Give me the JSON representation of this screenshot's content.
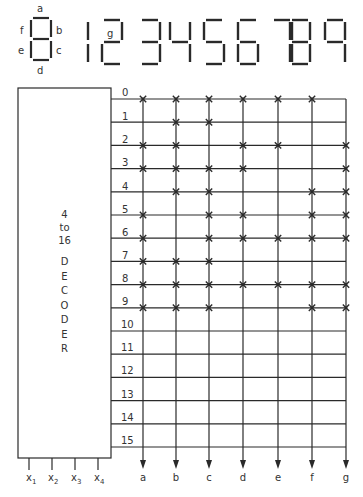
{
  "legend": {
    "segments": [
      {
        "name": "a",
        "label": "a"
      },
      {
        "name": "b",
        "label": "b"
      },
      {
        "name": "c",
        "label": "c"
      },
      {
        "name": "d",
        "label": "d"
      },
      {
        "name": "e",
        "label": "e"
      },
      {
        "name": "f",
        "label": "f"
      },
      {
        "name": "g",
        "label": "g"
      }
    ],
    "g_label": "g"
  },
  "digit_display": {
    "digits": [
      {
        "digit": "1",
        "segments": [
          "e",
          "f"
        ]
      },
      {
        "digit": "2",
        "segments": [
          "a",
          "b",
          "g",
          "e",
          "d"
        ]
      },
      {
        "digit": "3",
        "segments": [
          "a",
          "b",
          "g",
          "c",
          "d"
        ]
      },
      {
        "digit": "4",
        "segments": [
          "f",
          "g",
          "b",
          "c"
        ]
      },
      {
        "digit": "5",
        "segments": [
          "a",
          "f",
          "g",
          "c",
          "d"
        ]
      },
      {
        "digit": "6",
        "segments": [
          "a",
          "f",
          "g",
          "e",
          "c",
          "d"
        ]
      },
      {
        "digit": "7",
        "segments": [
          "a",
          "b",
          "c"
        ]
      },
      {
        "digit": "8",
        "segments": [
          "a",
          "b",
          "c",
          "d",
          "e",
          "f",
          "g"
        ]
      },
      {
        "digit": "9",
        "segments": [
          "a",
          "b",
          "c",
          "f",
          "g"
        ]
      }
    ]
  },
  "decoder": {
    "title_lines": [
      "4",
      "to",
      "16"
    ],
    "name_letters": [
      "D",
      "E",
      "C",
      "O",
      "D",
      "E",
      "R"
    ],
    "inputs": [
      {
        "base": "x",
        "sub": "1"
      },
      {
        "base": "x",
        "sub": "2"
      },
      {
        "base": "x",
        "sub": "3"
      },
      {
        "base": "x",
        "sub": "4"
      }
    ],
    "output_lines": [
      "0",
      "1",
      "2",
      "3",
      "4",
      "5",
      "6",
      "7",
      "8",
      "9",
      "10",
      "11",
      "12",
      "13",
      "14",
      "15"
    ]
  },
  "matrix": {
    "columns": [
      "a",
      "b",
      "c",
      "d",
      "e",
      "f",
      "g"
    ],
    "connections": {
      "0": [
        "a",
        "b",
        "c",
        "d",
        "e",
        "f"
      ],
      "1": [
        "b",
        "c"
      ],
      "2": [
        "a",
        "b",
        "d",
        "e",
        "g"
      ],
      "3": [
        "a",
        "b",
        "c",
        "d",
        "g"
      ],
      "4": [
        "b",
        "c",
        "f",
        "g"
      ],
      "5": [
        "a",
        "c",
        "d",
        "f",
        "g"
      ],
      "6": [
        "a",
        "c",
        "d",
        "e",
        "f",
        "g"
      ],
      "7": [
        "a",
        "b",
        "c"
      ],
      "8": [
        "a",
        "b",
        "c",
        "d",
        "e",
        "f",
        "g"
      ],
      "9": [
        "a",
        "b",
        "c",
        "f",
        "g"
      ],
      "10": [],
      "11": [],
      "12": [],
      "13": [],
      "14": [],
      "15": []
    },
    "connection_symbol": "×"
  },
  "colors": {
    "line": "#2a2a2a",
    "background": "#ffffff"
  }
}
